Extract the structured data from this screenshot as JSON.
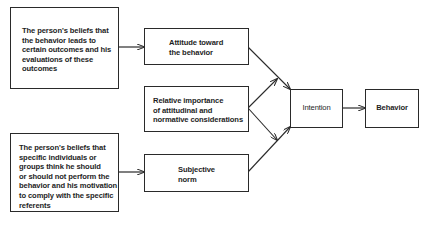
{
  "diagram": {
    "nodes": {
      "beliefs_outcomes": {
        "lines": [
          "The person's beliefs that",
          "the behavior leads to",
          "certain outcomes and his",
          "evaluations of these",
          "outcomes"
        ]
      },
      "beliefs_referents": {
        "lines": [
          "The person's beliefs that",
          "specific individuals or",
          "groups think he should",
          "or should not perform the",
          "behavior and his motivation",
          "to comply with the specific",
          "referents"
        ]
      },
      "attitude": {
        "lines": [
          "Attitude toward",
          "the behavior"
        ]
      },
      "relative_importance": {
        "lines": [
          "Relative importance",
          "of attitudinal and",
          "normative considerations"
        ]
      },
      "subjective_norm": {
        "lines": [
          "Subjective",
          "norm"
        ]
      },
      "intention": {
        "label": "Intention"
      },
      "behavior": {
        "label": "Behavior"
      }
    },
    "edges": [
      {
        "from": "beliefs_outcomes",
        "to": "attitude"
      },
      {
        "from": "beliefs_referents",
        "to": "subjective_norm"
      },
      {
        "from": "attitude",
        "to": "intention"
      },
      {
        "from": "subjective_norm",
        "to": "intention"
      },
      {
        "from": "relative_importance",
        "to": "attitude-intention link"
      },
      {
        "from": "relative_importance",
        "to": "norm-intention link"
      },
      {
        "from": "intention",
        "to": "behavior"
      }
    ],
    "colors": {
      "line": "#2a2a2a",
      "text": "#1e1e1e",
      "background": "#ffffff"
    }
  }
}
